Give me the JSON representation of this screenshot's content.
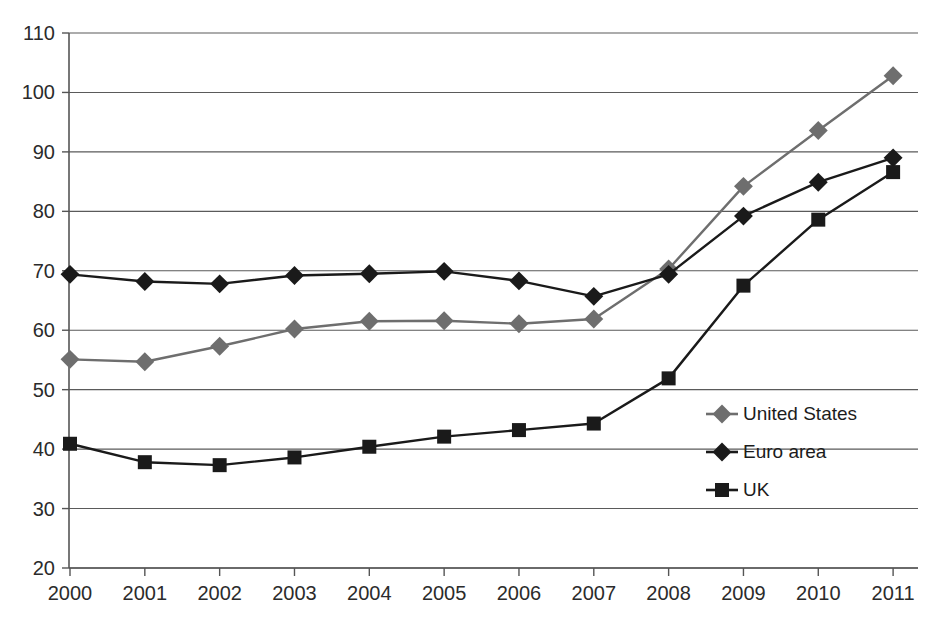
{
  "chart_data": {
    "type": "line",
    "title": "",
    "subtitle": "",
    "xlabel": "",
    "ylabel": "",
    "categories": [
      "2000",
      "2001",
      "2002",
      "2003",
      "2004",
      "2005",
      "2006",
      "2007",
      "2008",
      "2009",
      "2010",
      "2011"
    ],
    "x": [
      2000,
      2001,
      2002,
      2003,
      2004,
      2005,
      2006,
      2007,
      2008,
      2009,
      2010,
      2011
    ],
    "ylim": [
      20,
      110
    ],
    "xlim": [
      2000,
      2011
    ],
    "yticks": [
      20,
      30,
      40,
      50,
      60,
      70,
      80,
      90,
      100,
      110
    ],
    "grid": "horizontal",
    "legend_position": "right-center",
    "series": [
      {
        "name": "United States",
        "color": "#6e6e6e",
        "marker": "diamond",
        "values": [
          55.1,
          54.7,
          57.3,
          60.2,
          61.5,
          61.6,
          61.1,
          61.9,
          70.3,
          84.2,
          93.6,
          102.8
        ]
      },
      {
        "name": "Euro area",
        "color": "#1a1a1a",
        "marker": "diamond",
        "values": [
          69.4,
          68.2,
          67.8,
          69.2,
          69.5,
          69.9,
          68.3,
          65.7,
          69.4,
          79.2,
          84.9,
          89.0
        ]
      },
      {
        "name": "UK",
        "color": "#1a1a1a",
        "marker": "square",
        "values": [
          40.9,
          37.8,
          37.3,
          38.6,
          40.4,
          42.1,
          43.2,
          44.3,
          51.9,
          67.5,
          78.6,
          86.6
        ]
      }
    ]
  },
  "axes": {
    "y_tick_labels": [
      "110",
      "100",
      "90",
      "80",
      "70",
      "60",
      "50",
      "40",
      "30",
      "20"
    ],
    "x_tick_labels": [
      "2000",
      "2001",
      "2002",
      "2003",
      "2004",
      "2005",
      "2006",
      "2007",
      "2008",
      "2009",
      "2010",
      "2011"
    ]
  },
  "legend": {
    "items": [
      {
        "label": "United States",
        "color": "#6e6e6e",
        "marker": "diamond"
      },
      {
        "label": "Euro area",
        "color": "#1a1a1a",
        "marker": "diamond"
      },
      {
        "label": "UK",
        "color": "#1a1a1a",
        "marker": "square"
      }
    ]
  },
  "colors": {
    "background": "#ffffff",
    "grid": "#5a5a5a",
    "axis": "#555555",
    "text": "#2b2b2b",
    "series_us": "#6e6e6e",
    "series_euro": "#1a1a1a",
    "series_uk": "#1a1a1a"
  }
}
